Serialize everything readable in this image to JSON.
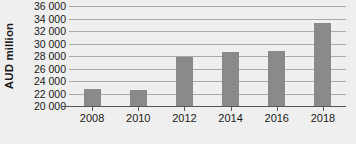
{
  "chart_data": {
    "type": "bar",
    "title": "",
    "subtitle": "",
    "xlabel": "",
    "ylabel": "AUD million",
    "categories": [
      "2008",
      "2010",
      "2012",
      "2014",
      "2016",
      "2018"
    ],
    "values": [
      22700,
      22500,
      27900,
      28600,
      28850,
      33350
    ],
    "series": [
      {
        "name": "AUD million",
        "values": [
          22700,
          22500,
          27900,
          28600,
          28850,
          33350
        ]
      }
    ],
    "ylim": [
      20000,
      36000
    ],
    "ytick_labels": [
      "20 000",
      "22 000",
      "24 000",
      "26 000",
      "28 000",
      "30 000",
      "32 000",
      "34 000",
      "36 000"
    ],
    "ytick_values": [
      20000,
      22000,
      24000,
      26000,
      28000,
      30000,
      32000,
      34000,
      36000
    ],
    "ytick_step": 2000,
    "xtick_labels": [
      "2008",
      "2010",
      "2012",
      "2014",
      "2016",
      "2018"
    ],
    "grid": true,
    "grid_axis": "y",
    "legend": false,
    "legend_position": "none",
    "bar_color": "#8a8a8a",
    "background_color": "#efefef",
    "gridline_color": "#a9a9a9",
    "axis_color": "#555555",
    "text_color": "#1a1a1a",
    "annotations": []
  }
}
